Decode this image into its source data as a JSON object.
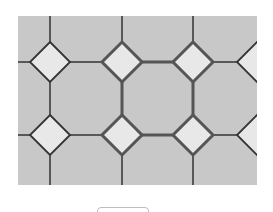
{
  "puzzle": {
    "type": "tile-pattern",
    "area": {
      "x": 18,
      "y": 16,
      "width": 239,
      "height": 169
    },
    "colors": {
      "background": "#ffffff",
      "octagon_fill": "#c8c8c8",
      "diamond_fill": "#e8e8e8",
      "line": "#333333",
      "highlight_line": "#555555"
    },
    "vertical_lines_x": [
      50,
      122,
      193
    ],
    "horizontal_lines_y": [
      62,
      135
    ],
    "diamonds": [
      {
        "cx": 50,
        "cy": 62,
        "r": 20,
        "highlighted": false
      },
      {
        "cx": 122,
        "cy": 62,
        "r": 20,
        "highlighted": true
      },
      {
        "cx": 193,
        "cy": 62,
        "r": 20,
        "highlighted": true
      },
      {
        "cx": 257,
        "cy": 62,
        "r": 20,
        "highlighted": false,
        "partial": true
      },
      {
        "cx": 50,
        "cy": 135,
        "r": 20,
        "highlighted": false
      },
      {
        "cx": 122,
        "cy": 135,
        "r": 20,
        "highlighted": true
      },
      {
        "cx": 193,
        "cy": 135,
        "r": 20,
        "highlighted": true
      },
      {
        "cx": 257,
        "cy": 135,
        "r": 20,
        "highlighted": false,
        "partial": true
      }
    ]
  },
  "button": {
    "label": ""
  }
}
